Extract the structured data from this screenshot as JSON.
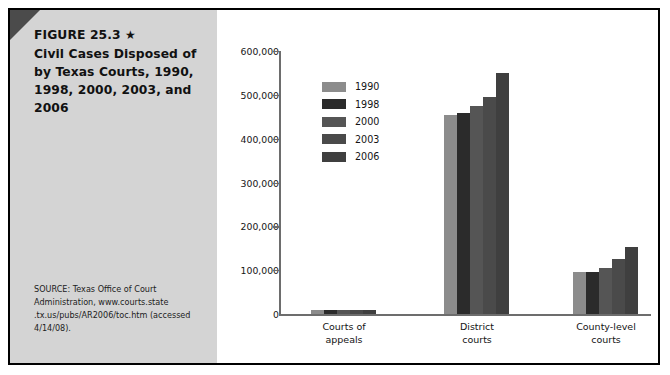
{
  "figure": {
    "label": "FIGURE 25.3",
    "star": "★",
    "title_line1": "Civil Cases Disposed of",
    "title_line2": "by Texas Courts, 1990,",
    "title_line3": "1998, 2000, 2003, and",
    "title_line4": "2006",
    "source": "SOURCE: Texas Office of Court Administration, www.courts.state .tx.us/pubs/AR2006/toc.htm (accessed 4/14/08)."
  },
  "colors": {
    "panel_background": "#d4d4d4",
    "corner_accent": "#4b4b4b",
    "frame": "#000000",
    "axis": "#6d6d6d",
    "series_1990": "#8c8c8c",
    "series_1998": "#2b2b2b",
    "series_2000": "#555555",
    "series_2003": "#4a4a4a",
    "series_2006": "#3f3f3f"
  },
  "chart_data": {
    "type": "bar",
    "title": "Civil Cases Disposed of by Texas Courts, 1990, 1998, 2000, 2003, and 2006",
    "xlabel": "",
    "ylabel": "",
    "categories": [
      "Courts of appeals",
      "District courts",
      "County-level courts"
    ],
    "category_lines": [
      [
        "Courts of",
        "appeals"
      ],
      [
        "District",
        "courts"
      ],
      [
        "County-level",
        "courts"
      ]
    ],
    "series": [
      {
        "name": "1990",
        "color": "#8c8c8c",
        "values": [
          9000,
          453000,
          95000
        ]
      },
      {
        "name": "1998",
        "color": "#2b2b2b",
        "values": [
          10000,
          459000,
          96000
        ]
      },
      {
        "name": "2000",
        "color": "#555555",
        "values": [
          10000,
          474000,
          104000
        ]
      },
      {
        "name": "2003",
        "color": "#4a4a4a",
        "values": [
          10000,
          494000,
          125000
        ]
      },
      {
        "name": "2006",
        "color": "#3f3f3f",
        "values": [
          10000,
          550000,
          152000
        ]
      }
    ],
    "ylim": [
      0,
      600000
    ],
    "yticks": [
      0,
      100000,
      200000,
      300000,
      400000,
      500000,
      600000
    ],
    "ytick_labels": [
      "0",
      "100,000",
      "200,000",
      "300,000",
      "400,000",
      "500,000",
      "600,000"
    ],
    "grid": false,
    "legend_position": "upper-left-inside"
  }
}
